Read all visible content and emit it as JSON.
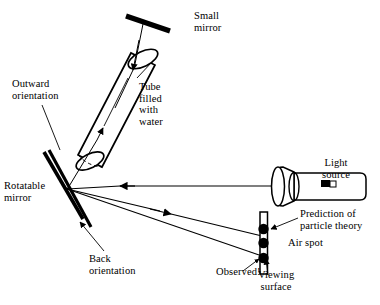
{
  "figure": {
    "background_color": "#ffffff",
    "ink_color": "#000000",
    "width": 380,
    "height": 305
  },
  "labels": {
    "small_mirror": "Small\nmirror",
    "tube_filled_with_water": "Tube\nfilled\nwith\nwater",
    "outward_orientation": "Outward\norientation",
    "rotatable_mirror": "Rotatable\nmirror",
    "back_orientation": "Back\norientation",
    "light_source": "Light\nsource",
    "prediction_of_particle_theory": "Prediction of\nparticle theory",
    "air_spot": "Air spot",
    "observed": "Observed!",
    "viewing_surface": "Viewing\nsurface"
  },
  "components": {
    "tube": {
      "name": "Tube filled with water",
      "orientation_degrees": 28,
      "internal_rays": 2,
      "ray_directions": [
        "up-toward-small-mirror",
        "down-toward-rotatable-mirror"
      ]
    },
    "small_mirror": {
      "name": "Small mirror",
      "shape": "angled bar",
      "position": "top of tube"
    },
    "rotatable_mirror": {
      "name": "Rotatable mirror",
      "orientations": [
        "Outward orientation",
        "Back orientation"
      ],
      "blade_count": 2
    },
    "light_source": {
      "name": "Light source",
      "shape": "cylindrical flashlight",
      "emits_toward": "rotatable mirror"
    },
    "viewing_surface": {
      "name": "Viewing surface",
      "shape": "vertical strip",
      "spots": [
        {
          "label": "Prediction of particle theory",
          "order": 1
        },
        {
          "label": "Air spot",
          "order": 2
        },
        {
          "label": "Observed!",
          "order": 3
        }
      ]
    }
  },
  "rays": [
    {
      "from": "Light source",
      "to": "Rotatable mirror",
      "arrow": "leftward"
    },
    {
      "from": "Rotatable mirror",
      "to": "Viewing surface",
      "arrow": "rightward-down"
    },
    {
      "from": "Rotatable mirror",
      "to": "Viewing surface",
      "arrow": "rightward-down-lower"
    },
    {
      "from": "Rotatable mirror",
      "to": "Tube",
      "arrow": "upward"
    },
    {
      "from": "Tube",
      "to": "Rotatable mirror",
      "arrow": "downward"
    }
  ]
}
